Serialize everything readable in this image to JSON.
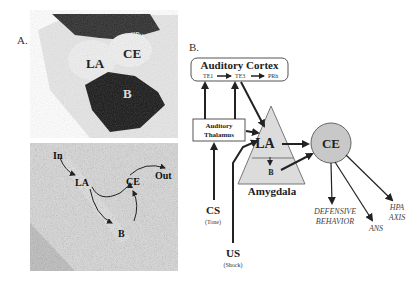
{
  "panel_a": {
    "label": "A.",
    "top_photo": {
      "labels": {
        "cpu": "CPu",
        "la": "LA",
        "ce": "CE",
        "b": "B"
      }
    },
    "bottom_photo": {
      "labels": {
        "in": "In",
        "la": "LA",
        "ce": "CE",
        "b": "B",
        "out": "Out"
      }
    }
  },
  "panel_b": {
    "label": "B.",
    "auditory_cortex": {
      "title": "Auditory Cortex",
      "areas": [
        "TE1",
        "TE3",
        "PRh"
      ]
    },
    "auditory_thalamus": {
      "line1": "Auditory",
      "line2": "Thalamus"
    },
    "amygdala": {
      "label": "Amygdala",
      "la": "LA",
      "b": "B",
      "ce": "CE"
    },
    "cs": {
      "label": "CS",
      "sub": "(Tone)"
    },
    "us": {
      "label": "US",
      "sub": "(Shock)"
    },
    "outputs": {
      "defensive_line1": "DEFENSIVE",
      "defensive_line2": "BEHAVIOR",
      "ans": "ANS",
      "hpa_line1": "HPA",
      "hpa_line2": "AXIS"
    },
    "colors": {
      "amygdala_fill": "#dcdcdc",
      "ce_fill": "#c8c8c8",
      "stroke": "#222222"
    }
  }
}
